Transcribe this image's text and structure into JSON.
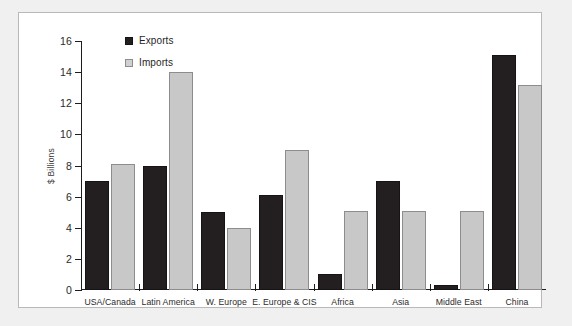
{
  "chart_data": {
    "type": "bar",
    "title": "",
    "xlabel": "",
    "ylabel": "$ Billions",
    "ylim": [
      0,
      16
    ],
    "yticks": [
      0,
      2,
      4,
      6,
      8,
      10,
      12,
      14,
      16
    ],
    "grid": false,
    "legend_position": "top-left",
    "categories": [
      "USA/Canada",
      "Latin America",
      "W. Europe",
      "E. Europe & CIS",
      "Africa",
      "Asia",
      "Middle East",
      "China"
    ],
    "series": [
      {
        "name": "Exports",
        "color": "#231f20",
        "values": [
          7.0,
          8.0,
          5.0,
          6.1,
          1.0,
          7.0,
          0.3,
          15.1
        ]
      },
      {
        "name": "Imports",
        "color": "#c8c8c8",
        "values": [
          8.1,
          14.0,
          4.0,
          9.0,
          5.1,
          5.1,
          5.1,
          13.2
        ]
      }
    ]
  },
  "legend": {
    "items": [
      {
        "label": "Exports",
        "swatch": "exports"
      },
      {
        "label": "Imports",
        "swatch": "imports"
      }
    ]
  },
  "colors": {
    "exports": "#231f20",
    "imports": "#c8c8c8",
    "axis": "#1d1d1d",
    "card_background": "#ffffff",
    "page_background": "#f0f0f0"
  }
}
